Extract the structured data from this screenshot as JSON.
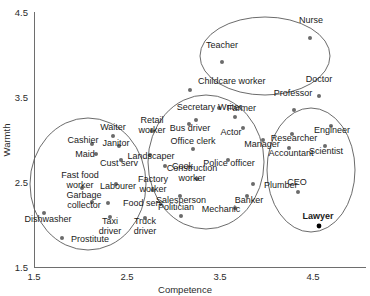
{
  "chart_data": {
    "type": "scatter",
    "title": "",
    "xlabel": "Competence",
    "ylabel": "Warmth",
    "xlim": [
      1.5,
      4.5
    ],
    "ylim": [
      1.5,
      4.5
    ],
    "xticks": [
      "1.5",
      "2.5",
      "3.5",
      "4.5"
    ],
    "yticks": [
      "1.5",
      "2.5",
      "3.5",
      "4.5"
    ],
    "grid": false,
    "legend": "none",
    "annotations": "Four hand-drawn cluster ellipses group occupations into stereotype-content quadrants; 'Lawyer' is emphasized in bold with a filled black marker.",
    "clusters": [
      {
        "name": "low-competence-moderate-warmth",
        "cx": 88,
        "cy": 184,
        "rx": 58,
        "ry": 66
      },
      {
        "name": "mid-competence-mid-warmth",
        "cx": 206,
        "cy": 162,
        "rx": 58,
        "ry": 67
      },
      {
        "name": "high-competence-high-warmth",
        "cx": 265,
        "cy": 56,
        "rx": 65,
        "ry": 39
      },
      {
        "name": "high-competence-low-warmth",
        "cx": 311,
        "cy": 170,
        "rx": 44,
        "ry": 62
      }
    ],
    "points": [
      {
        "label": "Teacher",
        "x": 3.42,
        "y": 4.12,
        "px": 222,
        "py": 62,
        "lx": 222,
        "ly": 48,
        "anchor": "middle",
        "highlight": false
      },
      {
        "label": "Nurse",
        "x": 3.93,
        "y": 4.24,
        "px": 310,
        "py": 38,
        "lx": 311,
        "ly": 23,
        "anchor": "middle",
        "highlight": false
      },
      {
        "label": "Childcare worker",
        "x": 3.0,
        "y": 3.82,
        "px": 190,
        "py": 90,
        "lx": 198,
        "ly": 84,
        "anchor": "start",
        "highlight": false
      },
      {
        "label": "Doctor",
        "x": 4.26,
        "y": 3.76,
        "px": 319,
        "py": 96,
        "lx": 319,
        "ly": 82,
        "anchor": "middle",
        "highlight": false
      },
      {
        "label": "Farmer",
        "x": 3.07,
        "y": 3.64,
        "px": 219,
        "py": 108,
        "lx": 227,
        "ly": 111,
        "anchor": "start",
        "highlight": false
      },
      {
        "label": "Professor",
        "x": 4.06,
        "y": 3.53,
        "px": 294,
        "py": 110,
        "lx": 293,
        "ly": 96,
        "anchor": "middle",
        "highlight": false
      },
      {
        "label": "Secretary",
        "x": 3.22,
        "y": 3.36,
        "px": 196,
        "py": 120,
        "lx": 196,
        "ly": 110,
        "anchor": "middle",
        "highlight": false
      },
      {
        "label": "Writer",
        "x": 3.47,
        "y": 3.38,
        "px": 235,
        "py": 117,
        "lx": 230,
        "ly": 110,
        "anchor": "middle",
        "highlight": false
      },
      {
        "label": "Retail worker",
        "x": 2.98,
        "y": 3.28,
        "px": 152,
        "py": 131,
        "lx": 152,
        "ly": 127,
        "anchor": "middle",
        "highlight": false,
        "two_line": "Retail|worker"
      },
      {
        "label": "Bus driver",
        "x": 3.18,
        "y": 3.26,
        "px": 189,
        "py": 124,
        "lx": 190,
        "ly": 131,
        "anchor": "middle",
        "highlight": false
      },
      {
        "label": "Actor",
        "x": 3.54,
        "y": 3.22,
        "px": 243,
        "py": 128,
        "lx": 231,
        "ly": 135,
        "anchor": "middle",
        "highlight": false
      },
      {
        "label": "Waiter",
        "x": 2.74,
        "y": 3.21,
        "px": 113,
        "py": 136,
        "lx": 113,
        "ly": 130,
        "anchor": "middle",
        "highlight": false
      },
      {
        "label": "Manager",
        "x": 3.7,
        "y": 3.15,
        "px": 263,
        "py": 140,
        "lx": 262,
        "ly": 147,
        "anchor": "middle",
        "highlight": false
      },
      {
        "label": "Cashier",
        "x": 2.62,
        "y": 3.12,
        "px": 92,
        "py": 144,
        "lx": 83,
        "ly": 143,
        "anchor": "middle",
        "highlight": false
      },
      {
        "label": "Janitor",
        "x": 2.7,
        "y": 3.1,
        "px": 119,
        "py": 146,
        "lx": 116,
        "ly": 146,
        "anchor": "middle",
        "highlight": false
      },
      {
        "label": "Office clerk",
        "x": 3.27,
        "y": 3.07,
        "px": 193,
        "py": 149,
        "lx": 193,
        "ly": 144,
        "anchor": "middle",
        "highlight": false
      },
      {
        "label": "Researcher",
        "x": 4.13,
        "y": 3.05,
        "px": 292,
        "py": 134,
        "lx": 294,
        "ly": 141,
        "anchor": "middle",
        "highlight": false
      },
      {
        "label": "Engineer",
        "x": 4.43,
        "y": 3.13,
        "px": 331,
        "py": 126,
        "lx": 332,
        "ly": 133,
        "anchor": "middle",
        "highlight": false
      },
      {
        "label": "Maid",
        "x": 2.65,
        "y": 3.0,
        "px": 96,
        "py": 154,
        "lx": 85,
        "ly": 157,
        "anchor": "middle",
        "highlight": false
      },
      {
        "label": "Landscaper",
        "x": 2.92,
        "y": 2.99,
        "px": 150,
        "py": 155,
        "lx": 151,
        "ly": 159,
        "anchor": "middle",
        "highlight": false
      },
      {
        "label": "Accountant",
        "x": 4.1,
        "y": 2.95,
        "px": 289,
        "py": 148,
        "lx": 291,
        "ly": 156,
        "anchor": "middle",
        "highlight": false
      },
      {
        "label": "Scientist",
        "x": 4.36,
        "y": 2.98,
        "px": 325,
        "py": 146,
        "lx": 326,
        "ly": 154,
        "anchor": "middle",
        "highlight": false
      },
      {
        "label": "Cust serv",
        "x": 2.74,
        "y": 2.93,
        "px": 121,
        "py": 160,
        "lx": 119,
        "ly": 166,
        "anchor": "middle",
        "highlight": false
      },
      {
        "label": "Police officer",
        "x": 3.44,
        "y": 2.9,
        "px": 228,
        "py": 160,
        "lx": 229,
        "ly": 166,
        "anchor": "middle",
        "highlight": false
      },
      {
        "label": "Cook",
        "x": 3.01,
        "y": 2.86,
        "px": 165,
        "py": 166,
        "lx": 172,
        "ly": 169,
        "anchor": "start",
        "highlight": false
      },
      {
        "label": "Construction worker",
        "x": 3.25,
        "y": 2.78,
        "px": 197,
        "py": 179,
        "lx": 192,
        "ly": 175,
        "anchor": "middle",
        "highlight": false,
        "two_line": "Construction|worker"
      },
      {
        "label": "Fast food worker",
        "x": 2.28,
        "y": 2.66,
        "px": 82,
        "py": 188,
        "lx": 80,
        "ly": 182,
        "anchor": "middle",
        "highlight": false,
        "two_line": "Fast food|worker"
      },
      {
        "label": "Labourer",
        "x": 2.62,
        "y": 2.69,
        "px": 116,
        "py": 184,
        "lx": 118,
        "ly": 189,
        "anchor": "middle",
        "highlight": false
      },
      {
        "label": "Factory worker",
        "x": 2.92,
        "y": 2.64,
        "px": 153,
        "py": 190,
        "lx": 153,
        "ly": 186,
        "anchor": "middle",
        "highlight": false,
        "two_line": "Factory|worker"
      },
      {
        "label": "Plumber",
        "x": 3.73,
        "y": 2.68,
        "px": 253,
        "py": 184,
        "lx": 264,
        "ly": 188,
        "anchor": "start",
        "highlight": false
      },
      {
        "label": "Salesperson",
        "x": 3.12,
        "y": 2.55,
        "px": 180,
        "py": 196,
        "lx": 181,
        "ly": 203,
        "anchor": "middle",
        "highlight": false
      },
      {
        "label": "Banker",
        "x": 3.72,
        "y": 2.53,
        "px": 247,
        "py": 196,
        "lx": 249,
        "ly": 203,
        "anchor": "middle",
        "highlight": false
      },
      {
        "label": "Garbage collector",
        "x": 2.35,
        "y": 2.5,
        "px": 92,
        "py": 202,
        "lx": 84,
        "ly": 202,
        "anchor": "middle",
        "highlight": false,
        "two_line": "Garbage|collector"
      },
      {
        "label": "Food serv",
        "x": 2.48,
        "y": 2.48,
        "px": 108,
        "py": 203,
        "lx": 123,
        "ly": 206,
        "anchor": "start",
        "highlight": false
      },
      {
        "label": "Mechanic",
        "x": 3.52,
        "y": 2.46,
        "px": 235,
        "py": 208,
        "lx": 221,
        "ly": 212,
        "anchor": "middle",
        "highlight": false
      },
      {
        "label": "CEO",
        "x": 4.13,
        "y": 2.4,
        "px": 298,
        "py": 192,
        "lx": 297,
        "ly": 185,
        "anchor": "middle",
        "highlight": false
      },
      {
        "label": "Dishwasher",
        "x": 2.0,
        "y": 2.38,
        "px": 44,
        "py": 213,
        "lx": 48,
        "ly": 222,
        "anchor": "middle",
        "highlight": false
      },
      {
        "label": "Politician",
        "x": 3.2,
        "y": 2.33,
        "px": 181,
        "py": 216,
        "lx": 176,
        "ly": 210,
        "anchor": "middle",
        "highlight": false
      },
      {
        "label": "Taxi driver",
        "x": 2.6,
        "y": 2.26,
        "px": 110,
        "py": 217,
        "lx": 110,
        "ly": 228,
        "anchor": "middle",
        "highlight": false,
        "two_line": "Taxi|driver"
      },
      {
        "label": "Truck driver",
        "x": 2.88,
        "y": 2.24,
        "px": 145,
        "py": 218,
        "lx": 145,
        "ly": 228,
        "anchor": "middle",
        "highlight": false,
        "two_line": "Truck|driver"
      },
      {
        "label": "Lawyer",
        "x": 4.26,
        "y": 2.14,
        "px": 319,
        "py": 226,
        "lx": 318,
        "ly": 219,
        "anchor": "middle",
        "highlight": true
      },
      {
        "label": "Prostitute",
        "x": 2.18,
        "y": 2.02,
        "px": 62,
        "py": 238,
        "lx": 90,
        "ly": 242,
        "anchor": "middle",
        "highlight": false
      }
    ]
  },
  "axes": {
    "x_title": "Competence",
    "y_title": "Warmth",
    "x_ticks": [
      {
        "label": "1.5",
        "px": 34
      },
      {
        "label": "2.5",
        "px": 127
      },
      {
        "label": "3.5",
        "px": 220
      },
      {
        "label": "4.5",
        "px": 313
      }
    ],
    "y_ticks": [
      {
        "label": "1.5",
        "py": 267
      },
      {
        "label": "2.5",
        "py": 182
      },
      {
        "label": "3.5",
        "py": 97
      },
      {
        "label": "4.5",
        "py": 12
      }
    ]
  },
  "style": {
    "axis_color": "#6e6e6e",
    "ellipse_color": "#5a5a5a",
    "point_color": "#6b6b6b",
    "highlight_color": "#000000",
    "text_color": "#1a1a1a",
    "background": "#ffffff"
  }
}
